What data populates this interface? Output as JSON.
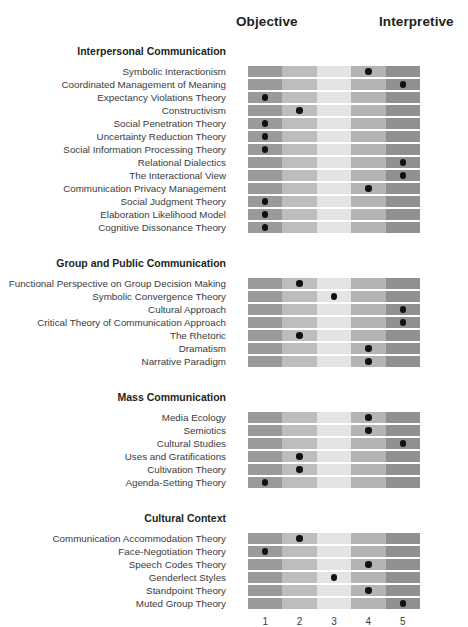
{
  "header": {
    "left_axis_label": "Objective",
    "right_axis_label": "Interpretive"
  },
  "axis": {
    "ticks": [
      "1",
      "2",
      "3",
      "4",
      "5"
    ]
  },
  "colors": {
    "col1": "#9a9a9c",
    "col2": "#bdbdbe",
    "col3": "#e4e4e5",
    "col4": "#b4b4b6",
    "col5": "#909091",
    "dot": "#111113",
    "text": "#3b3a3c",
    "heading": "#231f20"
  },
  "chart_data": {
    "type": "heatmap",
    "title": "",
    "xlabel": "",
    "ylabel": "",
    "x": [
      1,
      2,
      3,
      4,
      5
    ],
    "x_tick_labels": [
      "1",
      "2",
      "3",
      "4",
      "5"
    ],
    "xlim": [
      1,
      5
    ],
    "grid": false,
    "legend": "none",
    "annotations": [
      "Objective",
      "Interpretive"
    ],
    "groups": [
      {
        "name": "Interpersonal Communication",
        "rows": [
          {
            "label": "Symbolic Interactionism",
            "value": 4
          },
          {
            "label": "Coordinated Management of Meaning",
            "value": 5
          },
          {
            "label": "Expectancy Violations Theory",
            "value": 1
          },
          {
            "label": "Constructivism",
            "value": 2
          },
          {
            "label": "Social Penetration Theory",
            "value": 1
          },
          {
            "label": "Uncertainty Reduction Theory",
            "value": 1
          },
          {
            "label": "Social Information Processing Theory",
            "value": 1
          },
          {
            "label": "Relational Dialectics",
            "value": 5
          },
          {
            "label": "The Interactional View",
            "value": 5
          },
          {
            "label": "Communication Privacy Management",
            "value": 4
          },
          {
            "label": "Social Judgment Theory",
            "value": 1
          },
          {
            "label": "Elaboration Likelihood Model",
            "value": 1
          },
          {
            "label": "Cognitive Dissonance Theory",
            "value": 1
          }
        ]
      },
      {
        "name": "Group and Public Communication",
        "rows": [
          {
            "label": "Functional Perspective on Group Decision Making",
            "value": 2
          },
          {
            "label": "Symbolic Convergence Theory",
            "value": 3
          },
          {
            "label": "Cultural Approach",
            "value": 5
          },
          {
            "label": "Critical Theory of Communication Approach",
            "value": 5
          },
          {
            "label": "The Rhetoric",
            "value": 2
          },
          {
            "label": "Dramatism",
            "value": 4
          },
          {
            "label": "Narrative Paradigm",
            "value": 4
          }
        ]
      },
      {
        "name": "Mass Communication",
        "rows": [
          {
            "label": "Media Ecology",
            "value": 4
          },
          {
            "label": "Semiotics",
            "value": 4
          },
          {
            "label": "Cultural Studies",
            "value": 5
          },
          {
            "label": "Uses and Gratifications",
            "value": 2
          },
          {
            "label": "Cultivation Theory",
            "value": 2
          },
          {
            "label": "Agenda-Setting Theory",
            "value": 1
          }
        ]
      },
      {
        "name": "Cultural Context",
        "rows": [
          {
            "label": "Communication Accommodation Theory",
            "value": 2
          },
          {
            "label": "Face-Negotiation Theory",
            "value": 1
          },
          {
            "label": "Speech Codes Theory",
            "value": 4
          },
          {
            "label": "Genderlect Styles",
            "value": 3
          },
          {
            "label": "Standpoint Theory",
            "value": 4
          },
          {
            "label": "Muted Group Theory",
            "value": 5
          }
        ]
      }
    ]
  }
}
